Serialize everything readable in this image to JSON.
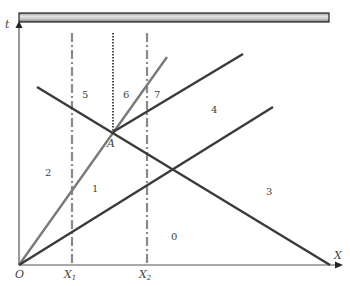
{
  "diagram": {
    "type": "wave-diagram-x-t",
    "axes": {
      "vertical_label": "t",
      "horizontal_label": "X",
      "origin_label": "O",
      "tick_labels": [
        "X",
        "X"
      ],
      "tick_subscripts": [
        "1",
        "2"
      ]
    },
    "point_label": "A",
    "regions": [
      {
        "id": "0",
        "label": "0"
      },
      {
        "id": "1",
        "label": "1"
      },
      {
        "id": "2",
        "label": "2"
      },
      {
        "id": "3",
        "label": "3"
      },
      {
        "id": "4",
        "label": "4"
      },
      {
        "id": "5",
        "label": "5"
      },
      {
        "id": "6",
        "label": "6"
      },
      {
        "id": "7",
        "label": "7"
      }
    ],
    "colors": {
      "dark_line": "#3a3a3a",
      "grey_line": "#7a7a7a",
      "dashdot_line": "#8a8a8a",
      "axis": "#555555",
      "bar_fill": "#b8b8b8"
    }
  }
}
